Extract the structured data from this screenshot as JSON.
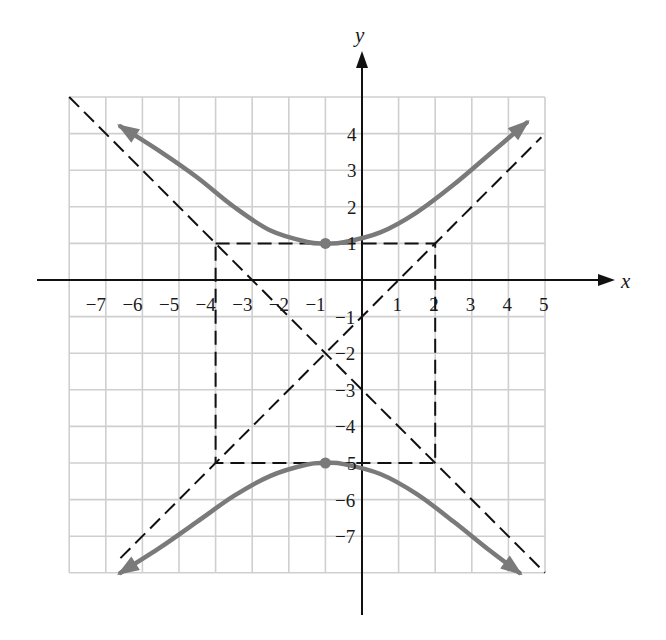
{
  "chart_data": {
    "type": "line",
    "title": "",
    "xlabel": "x",
    "ylabel": "y",
    "xlim": [
      -8,
      5
    ],
    "ylim": [
      -8,
      5
    ],
    "grid": true,
    "x_ticks": [
      -7,
      -6,
      -5,
      -4,
      -3,
      -2,
      -1,
      1,
      2,
      3,
      4,
      5
    ],
    "x_tick_labels": [
      "−7",
      "−6",
      "−5",
      "−4",
      "−3",
      "−2",
      "−1",
      "1",
      "2",
      "3",
      "4",
      "5"
    ],
    "y_ticks": [
      4,
      3,
      2,
      1,
      -1,
      -2,
      -3,
      -4,
      -5,
      -6,
      -7
    ],
    "y_tick_labels": [
      "4",
      "3",
      "2",
      "1",
      "−1",
      "−2",
      "−3",
      "−4",
      "5",
      "−6",
      "−7"
    ],
    "equation": "(y+2)^2/9 - (x+1)^2/9 = 1",
    "center": [
      -1,
      -2
    ],
    "vertices": [
      [
        -1,
        1
      ],
      [
        -1,
        -5
      ]
    ],
    "series": [
      {
        "name": "upper branch",
        "style": "solid-gray-arrows",
        "points": [
          [
            -6.6,
            4.2
          ],
          [
            -5.5,
            3.5
          ],
          [
            -4.5,
            2.8
          ],
          [
            -3.5,
            2.0
          ],
          [
            -2.5,
            1.35
          ],
          [
            -1.5,
            1.04
          ],
          [
            -1,
            1
          ],
          [
            -0.5,
            1.03
          ],
          [
            0.5,
            1.3
          ],
          [
            1.5,
            1.85
          ],
          [
            2.5,
            2.6
          ],
          [
            3.5,
            3.45
          ],
          [
            4.5,
            4.3
          ]
        ]
      },
      {
        "name": "lower branch",
        "style": "solid-gray-arrows",
        "points": [
          [
            -6.6,
            -8.0
          ],
          [
            -5.5,
            -7.3
          ],
          [
            -4.5,
            -6.6
          ],
          [
            -3.5,
            -5.9
          ],
          [
            -2.5,
            -5.35
          ],
          [
            -1.5,
            -5.04
          ],
          [
            -1,
            -5
          ],
          [
            -0.5,
            -5.03
          ],
          [
            0.5,
            -5.3
          ],
          [
            1.5,
            -5.85
          ],
          [
            2.5,
            -6.6
          ],
          [
            3.5,
            -7.4
          ],
          [
            4.3,
            -8.0
          ]
        ]
      },
      {
        "name": "asymptote y = -x - 3",
        "style": "dashed",
        "points": [
          [
            -8,
            5
          ],
          [
            5,
            -8
          ]
        ]
      },
      {
        "name": "asymptote y = x - 1",
        "style": "dashed",
        "points": [
          [
            -6.6,
            -7.6
          ],
          [
            4.9,
            3.9
          ]
        ]
      },
      {
        "name": "fundamental rectangle",
        "style": "dashed",
        "points": [
          [
            -4,
            1
          ],
          [
            2,
            1
          ],
          [
            2,
            -5
          ],
          [
            -4,
            -5
          ],
          [
            -4,
            1
          ]
        ]
      }
    ],
    "markers": [
      {
        "name": "vertex-top",
        "point": [
          -1,
          1
        ]
      },
      {
        "name": "vertex-bottom",
        "point": [
          -1,
          -5
        ]
      }
    ],
    "colors": {
      "curve": "#7a7a7a",
      "grid": "#cfcfcf",
      "axis": "#111111",
      "dash": "#111111"
    }
  }
}
